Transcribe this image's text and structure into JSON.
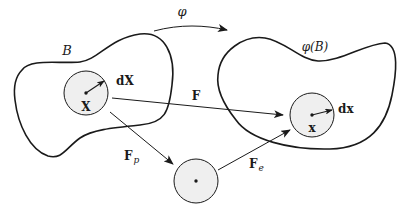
{
  "diagram": {
    "type": "multiplicative-decomposition-of-deformation-gradient",
    "colors": {
      "stroke": "#1a1a1a",
      "fill_neighborhood": "#efefef",
      "background": "#ffffff"
    },
    "bodies": {
      "reference": {
        "label": "B"
      },
      "current": {
        "label": "φ(B)"
      }
    },
    "mapping": {
      "label": "φ"
    },
    "points": {
      "reference": {
        "label": "X",
        "vector_label": "dX"
      },
      "current": {
        "label": "x",
        "vector_label": "dx"
      },
      "intermediate": {
        "label": ""
      }
    },
    "arrows": {
      "total": {
        "label": "F"
      },
      "plastic": {
        "label": "F",
        "subscript": "p"
      },
      "elastic": {
        "label": "F",
        "subscript": "e"
      }
    }
  }
}
